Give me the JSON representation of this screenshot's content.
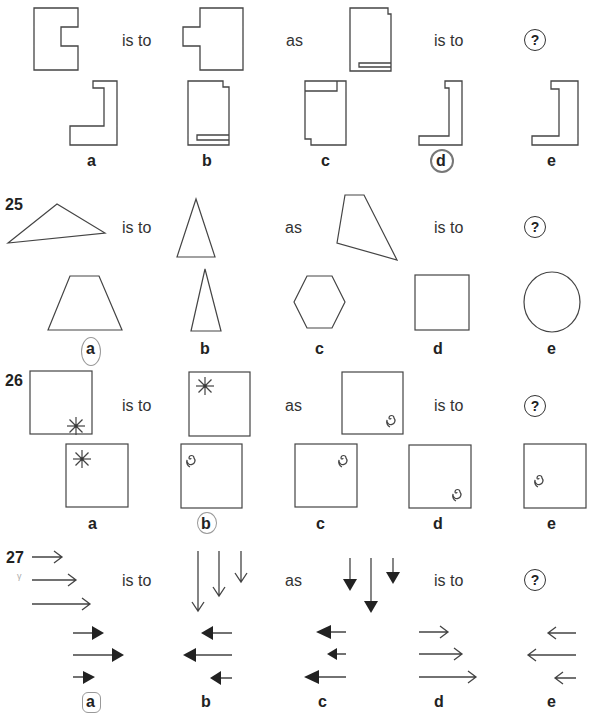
{
  "questions": [
    {
      "number": "",
      "relation": {
        "is_to_1": "is to",
        "as": "as",
        "is_to_2": "is to",
        "unknown": "?"
      },
      "stimuli": [
        "notched-rectangle",
        "mirrored-notched-rectangle",
        "rectangle-with-bottom-slot"
      ],
      "options": [
        {
          "label": "a",
          "shape": "l-shape-right"
        },
        {
          "label": "b",
          "shape": "rectangle-with-bottom-slot-notched"
        },
        {
          "label": "c",
          "shape": "rectangle-with-top-slot"
        },
        {
          "label": "d",
          "shape": "narrow-l-with-slot",
          "circled": true
        },
        {
          "label": "e",
          "shape": "bracket-shape"
        }
      ]
    },
    {
      "number": "25",
      "relation": {
        "is_to_1": "is to",
        "as": "as",
        "is_to_2": "is to",
        "unknown": "?"
      },
      "stimuli": [
        "scalene-triangle",
        "equilateral-triangle",
        "irregular-quadrilateral"
      ],
      "options": [
        {
          "label": "a",
          "shape": "trapezoid",
          "circled": true
        },
        {
          "label": "b",
          "shape": "tall-isosceles-triangle"
        },
        {
          "label": "c",
          "shape": "hexagon"
        },
        {
          "label": "d",
          "shape": "square"
        },
        {
          "label": "e",
          "shape": "circle"
        }
      ]
    },
    {
      "number": "26",
      "relation": {
        "is_to_1": "is to",
        "as": "as",
        "is_to_2": "is to",
        "unknown": "?"
      },
      "stimuli": [
        "square-star-bottom-right",
        "square-star-top-left",
        "square-spiral-bottom-right"
      ],
      "options": [
        {
          "label": "a",
          "shape": "square-star-top-left"
        },
        {
          "label": "b",
          "shape": "square-spiral-top-left",
          "circled": true
        },
        {
          "label": "c",
          "shape": "square-spiral-top-right"
        },
        {
          "label": "d",
          "shape": "square-spiral-bottom-right"
        },
        {
          "label": "e",
          "shape": "square-spiral-middle-left"
        }
      ]
    },
    {
      "number": "27",
      "relation": {
        "is_to_1": "is to",
        "as": "as",
        "is_to_2": "is to",
        "unknown": "?"
      },
      "stimuli": [
        "three-open-arrows-right",
        "three-open-arrows-down",
        "three-filled-arrows-down"
      ],
      "options": [
        {
          "label": "a",
          "shape": "filled-arrows-right",
          "circled": true
        },
        {
          "label": "b",
          "shape": "filled-arrows-left"
        },
        {
          "label": "c",
          "shape": "filled-arrows-left-alt"
        },
        {
          "label": "d",
          "shape": "open-arrows-right"
        },
        {
          "label": "e",
          "shape": "open-arrows-left"
        }
      ]
    }
  ]
}
